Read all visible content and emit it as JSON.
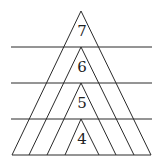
{
  "diagram": {
    "labels": [
      "7",
      "6",
      "5",
      "4"
    ]
  }
}
